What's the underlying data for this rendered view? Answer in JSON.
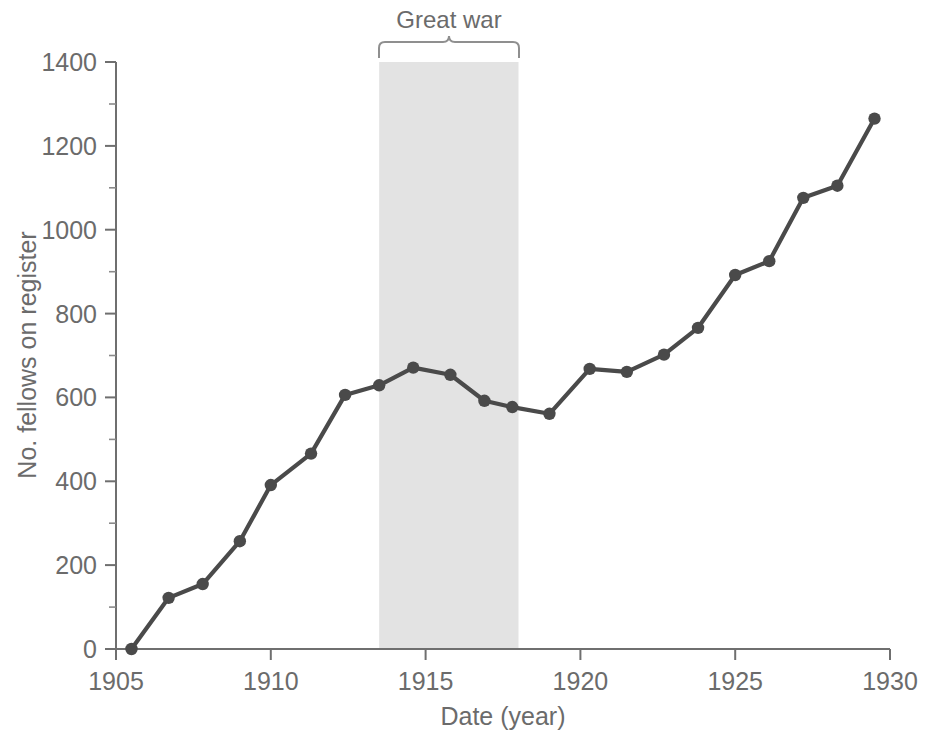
{
  "chart_data": {
    "type": "line",
    "title": "",
    "xlabel": "Date (year)",
    "ylabel": "No. fellows on register",
    "xlim": [
      1905,
      1930
    ],
    "ylim": [
      0,
      1400
    ],
    "xticks": [
      1905,
      1910,
      1915,
      1920,
      1925,
      1930
    ],
    "xtick_labels": [
      "1905",
      "1910",
      "1915",
      "1920",
      "1925",
      "1930"
    ],
    "yticks": [
      0,
      200,
      400,
      600,
      800,
      1000,
      1200,
      1400
    ],
    "ytick_labels": [
      "0",
      "200",
      "400",
      "600",
      "800",
      "1000",
      "1200",
      "1400"
    ],
    "y_minor_ticks": [
      100,
      300,
      500,
      700,
      900,
      1100,
      1300
    ],
    "grid": false,
    "legend": "none",
    "series": [
      {
        "name": "No. fellows on register",
        "color": "#4a4a4a",
        "marker": "circle",
        "x": [
          1905.5,
          1906.7,
          1907.8,
          1909.0,
          1910.0,
          1911.3,
          1912.4,
          1913.5,
          1914.6,
          1915.8,
          1916.9,
          1917.8,
          1919.0,
          1920.3,
          1921.5,
          1922.7,
          1923.8,
          1925.0,
          1926.1,
          1927.2,
          1928.3,
          1929.5
        ],
        "y": [
          0,
          122,
          155,
          257,
          391,
          466,
          606,
          629,
          671,
          654,
          592,
          577,
          561,
          668,
          661,
          702,
          766,
          892,
          925,
          1076,
          1105,
          1265
        ]
      }
    ],
    "annotations": [
      {
        "label": "Great war",
        "type": "shaded-band-with-brace",
        "x_start": 1913.5,
        "x_end": 1918.0,
        "band_color": "#e3e3e3"
      }
    ]
  },
  "axes": {
    "y_axis_title": "No. fellows on register",
    "x_axis_title": "Date (year)"
  },
  "annotation": {
    "great_war_label": "Great war"
  }
}
